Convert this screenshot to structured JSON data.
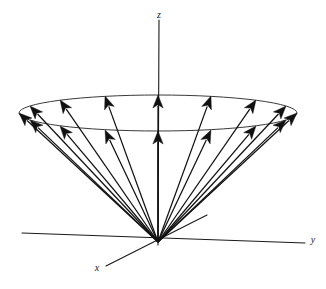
{
  "figure": {
    "background_color": "#ffffff",
    "line_color": "#111111",
    "ellipse_color": "#3a3a3a"
  },
  "axes": {
    "origin": {
      "x": 158,
      "y": 242
    },
    "z": {
      "label": "z",
      "label_x": 159,
      "label_y": 16,
      "x1": 159,
      "y1": 20,
      "x2": 158,
      "y2": 245
    },
    "y": {
      "label": "y",
      "label_x": 313,
      "label_y": 241,
      "x1": 22,
      "y1": 233,
      "x2": 305,
      "y2": 243
    },
    "x": {
      "label": "x",
      "label_x": 97,
      "label_y": 269,
      "x1": 207,
      "y1": 215,
      "x2": 106,
      "y2": 266
    }
  },
  "cone": {
    "apex": {
      "x": 158,
      "y": 242
    },
    "ellipse": {
      "center_x": 158,
      "center_y": 113,
      "radius_x": 139,
      "radius_y": 18
    },
    "vector_count": 16,
    "note": "Arrow tips lie on the ellipse; back-half tips sit higher, front-half tips sit lower."
  },
  "chart_data": {
    "type": "scatter",
    "xlabel": "x",
    "ylabel": "y",
    "zlabel": "z",
    "grid": false,
    "legend": null,
    "annotations": [
      "x",
      "y",
      "z"
    ],
    "vectors": [
      {
        "index": 0,
        "angle_deg": 0,
        "tip_x": 297,
        "tip_y": 113
      },
      {
        "index": 1,
        "angle_deg": 22.5,
        "tip_x": 286,
        "tip_y": 106
      },
      {
        "index": 2,
        "angle_deg": 45,
        "tip_x": 256,
        "tip_y": 100
      },
      {
        "index": 3,
        "angle_deg": 67.5,
        "tip_x": 211,
        "tip_y": 96
      },
      {
        "index": 4,
        "angle_deg": 90,
        "tip_x": 158,
        "tip_y": 95
      },
      {
        "index": 5,
        "angle_deg": 112.5,
        "tip_x": 105,
        "tip_y": 96
      },
      {
        "index": 6,
        "angle_deg": 135,
        "tip_x": 60,
        "tip_y": 100
      },
      {
        "index": 7,
        "angle_deg": 157.5,
        "tip_x": 30,
        "tip_y": 106
      },
      {
        "index": 8,
        "angle_deg": 180,
        "tip_x": 19,
        "tip_y": 113
      },
      {
        "index": 9,
        "angle_deg": 202.5,
        "tip_x": 30,
        "tip_y": 120
      },
      {
        "index": 10,
        "angle_deg": 225,
        "tip_x": 60,
        "tip_y": 126
      },
      {
        "index": 11,
        "angle_deg": 247.5,
        "tip_x": 105,
        "tip_y": 130
      },
      {
        "index": 12,
        "angle_deg": 270,
        "tip_x": 158,
        "tip_y": 131
      },
      {
        "index": 13,
        "angle_deg": 292.5,
        "tip_x": 211,
        "tip_y": 130
      },
      {
        "index": 14,
        "angle_deg": 315,
        "tip_x": 256,
        "tip_y": 126
      },
      {
        "index": 15,
        "angle_deg": 337.5,
        "tip_x": 286,
        "tip_y": 120
      }
    ]
  }
}
